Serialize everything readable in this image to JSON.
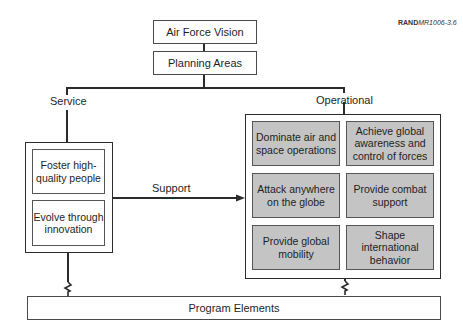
{
  "figure_id": {
    "bold": "RAND",
    "rest": "MR1006-3.6"
  },
  "top": {
    "vision": "Air Force Vision",
    "planning": "Planning Areas"
  },
  "branches": {
    "service": "Service",
    "operational": "Operational",
    "support": "Support"
  },
  "service_items": [
    "Foster high-quality people",
    "Evolve through innovation"
  ],
  "operational_items": [
    "Dominate air and space operations",
    "Achieve global awareness and control of forces",
    "Attack anywhere on the globe",
    "Provide combat support",
    "Provide global mobility",
    "Shape international behavior"
  ],
  "bottom": {
    "program": "Program Elements"
  },
  "colors": {
    "line": "#2b2b2b",
    "cell_fill": "#c4c4c4",
    "box_fill": "#ffffff"
  }
}
